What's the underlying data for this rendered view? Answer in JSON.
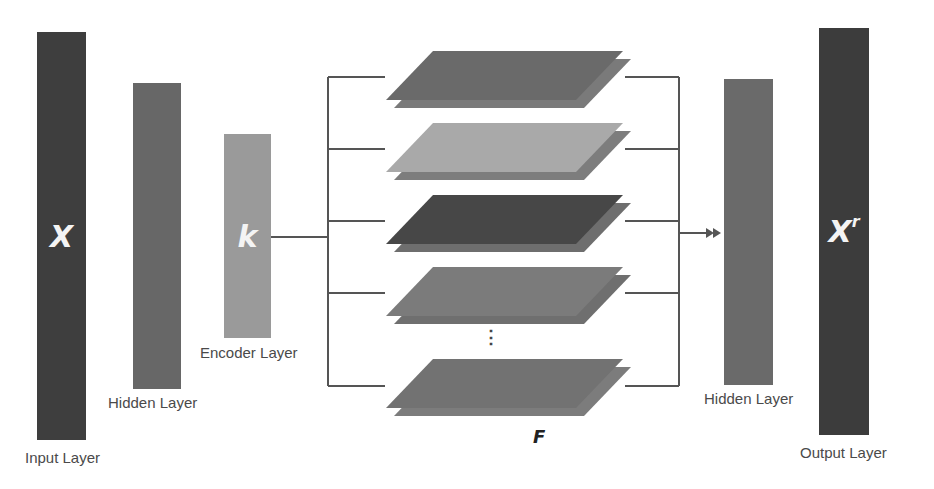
{
  "diagram": {
    "type": "autoencoder-architecture",
    "layers": [
      {
        "id": "input",
        "label": "Input Layer",
        "symbol": "X",
        "color": "#3e3e3e"
      },
      {
        "id": "hidden-left",
        "label": "Hidden Layer",
        "symbol": "",
        "color": "#676767"
      },
      {
        "id": "encoder",
        "label": "Encoder Layer",
        "symbol": "k",
        "color": "#9a9a9a"
      },
      {
        "id": "hidden-right",
        "label": "Hidden Layer",
        "symbol": "",
        "color": "#6a6a6a"
      },
      {
        "id": "output",
        "label": "Output Layer",
        "symbol": "X",
        "symbol_sup": "r",
        "color": "#3c3c3c"
      }
    ],
    "feature_maps": {
      "label": "F",
      "ellipsis": "⋮",
      "sheets": [
        {
          "front": "#6a6a6a",
          "back": "#7a7a7a"
        },
        {
          "front": "#a9a9a9",
          "back": "#7d7d7d"
        },
        {
          "front": "#474747",
          "back": "#6e6e6e"
        },
        {
          "front": "#7b7b7b",
          "back": "#6f6f6f"
        },
        {
          "front": "#727272",
          "back": "#7c7c7c"
        }
      ]
    },
    "connector_color": "#555555"
  }
}
